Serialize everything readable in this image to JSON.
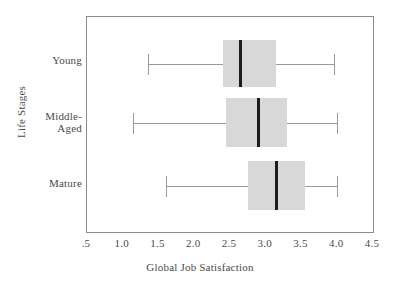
{
  "chart_data": {
    "type": "box",
    "title": "",
    "xlabel": "Global Job Satisfaction",
    "ylabel": "Life Stages",
    "xlim": [
      0.5,
      4.5
    ],
    "xticks": [
      ".5",
      "1.0",
      "1.5",
      "2.0",
      "2.5",
      "3.0",
      "3.5",
      "4.0",
      "4.5"
    ],
    "xtick_values": [
      0.5,
      1.0,
      1.5,
      2.0,
      2.5,
      3.0,
      3.5,
      4.0,
      4.5
    ],
    "grid": false,
    "legend": "none",
    "orientation": "horizontal",
    "categories": [
      "Young",
      "Middle-Aged",
      "Mature"
    ],
    "boxes": [
      {
        "category": "Young",
        "label_lines": [
          "Young"
        ],
        "whisker_low": 1.35,
        "q1": 2.4,
        "median": 2.65,
        "q3": 3.15,
        "whisker_high": 3.95
      },
      {
        "category": "Middle-Aged",
        "label_lines": [
          "Middle-",
          "Aged"
        ],
        "whisker_low": 1.15,
        "q1": 2.45,
        "median": 2.9,
        "q3": 3.3,
        "whisker_high": 4.0
      },
      {
        "category": "Mature",
        "label_lines": [
          "Mature"
        ],
        "whisker_low": 1.6,
        "q1": 2.75,
        "median": 3.15,
        "q3": 3.55,
        "whisker_high": 4.0
      }
    ],
    "colors": {
      "box_fill": "#d8d8d8",
      "median": "#1c1c1c",
      "whisker": "#9a9a9a",
      "frame": "#8c8c8c",
      "text": "#4a4a4a",
      "background": "#ffffff"
    }
  },
  "xtick_labels": {
    "t0": ".5",
    "t1": "1.0",
    "t2": "1.5",
    "t3": "2.0",
    "t4": "2.5",
    "t5": "3.0",
    "t6": "3.5",
    "t7": "4.0",
    "t8": "4.5"
  },
  "category_labels": {
    "young": "Young",
    "middle_line1": "Middle-",
    "middle_line2": "Aged",
    "mature": "Mature"
  },
  "axis_titles": {
    "x": "Global Job Satisfaction",
    "y": "Life Stages"
  }
}
